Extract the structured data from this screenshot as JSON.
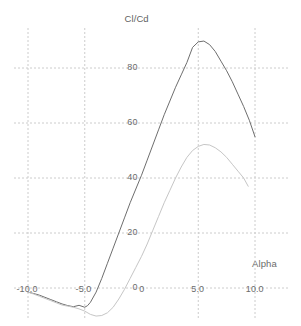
{
  "chart_data": {
    "type": "line",
    "title": "Cl/Cd",
    "subtitle": "",
    "xlabel": "Alpha",
    "ylabel": "",
    "xlim": [
      -11.5,
      11.5
    ],
    "ylim": [
      -13,
      97
    ],
    "xticks": [
      -10,
      -5,
      0,
      5,
      10
    ],
    "xticklabels": [
      "-10.0",
      "-5.0",
      "0",
      "5.0",
      "10.0"
    ],
    "yticks": [
      0,
      20,
      40,
      60,
      80
    ],
    "yticklabels": [
      "0",
      "20",
      "40",
      "60",
      "80"
    ],
    "grid": true,
    "grid_style": "dashed",
    "grid_color": "#cccccc",
    "gridlines_x": [
      -10,
      -5,
      5,
      10
    ],
    "gridlines_y": [
      0,
      20,
      40,
      60,
      80
    ],
    "legend": "none",
    "background": "#ffffff",
    "series": [
      {
        "name": "Cl/Cd curve 1",
        "color": "#6e6e6e",
        "width": 1,
        "x": [
          -10.0,
          -9.5,
          -9.0,
          -8.5,
          -8.0,
          -7.5,
          -7.0,
          -6.5,
          -6.0,
          -5.5,
          -5.0,
          -4.75,
          -4.5,
          -4.0,
          -3.5,
          -3.0,
          -2.5,
          -2.0,
          -1.5,
          -1.0,
          -0.5,
          0.0,
          0.5,
          1.0,
          1.5,
          2.0,
          2.5,
          3.0,
          3.5,
          4.0,
          4.5,
          5.0,
          5.5,
          6.0,
          6.5,
          7.0,
          7.5,
          8.0,
          8.5,
          9.0,
          9.5,
          10.0
        ],
        "y": [
          -1.5,
          -2.0,
          -2.6,
          -3.4,
          -4.2,
          -5.0,
          -5.8,
          -6.4,
          -6.8,
          -6.3,
          -7.0,
          -6.4,
          -5.2,
          -1.5,
          3.5,
          9.0,
          14.5,
          20.0,
          25.5,
          31.0,
          36.0,
          41.0,
          46.5,
          52.0,
          57.5,
          63.0,
          68.0,
          73.0,
          77.5,
          82.0,
          87.5,
          89.5,
          89.8,
          88.5,
          86.0,
          82.5,
          79.0,
          75.0,
          70.5,
          66.0,
          61.0,
          55.0
        ]
      },
      {
        "name": "Cl/Cd curve 2",
        "color": "#c6c6c6",
        "width": 1,
        "x": [
          -10.0,
          -9.5,
          -9.0,
          -8.5,
          -8.0,
          -7.5,
          -7.0,
          -6.5,
          -6.0,
          -5.5,
          -5.0,
          -4.5,
          -4.0,
          -3.5,
          -3.0,
          -2.5,
          -2.0,
          -1.5,
          -1.0,
          -0.5,
          0.0,
          0.5,
          1.0,
          1.5,
          2.0,
          2.5,
          3.0,
          3.5,
          4.0,
          4.5,
          5.0,
          5.5,
          6.0,
          6.5,
          7.0,
          7.5,
          8.0,
          8.5,
          9.0,
          9.4
        ],
        "y": [
          -1.5,
          -2.2,
          -3.0,
          -3.8,
          -4.6,
          -5.4,
          -6.2,
          -6.6,
          -7.0,
          -7.6,
          -8.4,
          -9.6,
          -10.2,
          -10.0,
          -9.0,
          -7.0,
          -4.0,
          -0.5,
          3.5,
          7.5,
          11.5,
          16.0,
          21.0,
          26.0,
          31.0,
          35.5,
          40.0,
          44.0,
          47.5,
          50.0,
          51.5,
          52.2,
          52.0,
          51.0,
          49.5,
          47.5,
          45.0,
          42.5,
          40.0,
          37.0
        ]
      }
    ]
  }
}
